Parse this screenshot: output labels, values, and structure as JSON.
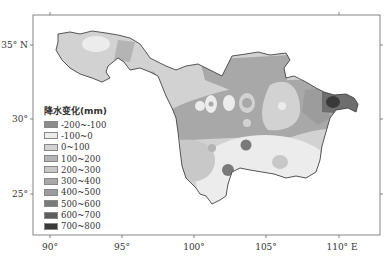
{
  "map": {
    "legend": {
      "title": "降水变化(mm)",
      "items": [
        {
          "label": "-200~-100",
          "color": "#8c8c8c"
        },
        {
          "label": "-100~0",
          "color": "#ececec"
        },
        {
          "label": "0~100",
          "color": "#d2d2d2"
        },
        {
          "label": "100~200",
          "color": "#b4b4b4"
        },
        {
          "label": "200~300",
          "color": "#c8c8c8"
        },
        {
          "label": "300~400",
          "color": "#a8a8a8"
        },
        {
          "label": "400~500",
          "color": "#9c9c9c"
        },
        {
          "label": "500~600",
          "color": "#7a7a7a"
        },
        {
          "label": "600~700",
          "color": "#5c5c5c"
        },
        {
          "label": "700~800",
          "color": "#3a3a3a"
        }
      ]
    },
    "axes": {
      "x_ticks": [
        "90°",
        "95°",
        "100°",
        "105°",
        "110° E"
      ],
      "y_ticks": [
        "35° N",
        "30°",
        "25°"
      ]
    }
  }
}
